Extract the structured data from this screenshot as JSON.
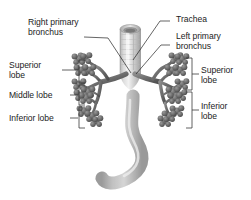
{
  "figure": {
    "background_color": "#ffffff",
    "text_color": "#1c1c1c",
    "airway_color": "#7b7b7b",
    "airway_dark_color": "#5d5d5d",
    "tube_light_color": "#cfcfcf"
  },
  "labels": {
    "right_primary_bronchus": "Right primary\nbronchus",
    "trachea": "Trachea",
    "left_primary_bronchus": "Left primary\nbronchus",
    "left_superior_lobe": "Superior\nlobe",
    "left_middle_lobe": "Middle lobe",
    "left_inferior_lobe": "Inferior lobe",
    "right_superior_lobe": "Superior\nlobe",
    "right_inferior_lobe": "Inferior\nlobe"
  },
  "structures": [
    {
      "name": "trachea",
      "label": "Trachea"
    },
    {
      "name": "right-primary-bronchus",
      "label": "Right primary bronchus"
    },
    {
      "name": "left-primary-bronchus",
      "label": "Left primary bronchus"
    },
    {
      "name": "right-lung-superior-lobe",
      "label": "Superior lobe"
    },
    {
      "name": "right-lung-middle-lobe",
      "label": "Middle lobe"
    },
    {
      "name": "right-lung-inferior-lobe",
      "label": "Inferior lobe"
    },
    {
      "name": "left-lung-superior-lobe",
      "label": "Superior lobe"
    },
    {
      "name": "left-lung-inferior-lobe",
      "label": "Inferior lobe"
    },
    {
      "name": "esophagus",
      "label": "Esophagus"
    }
  ]
}
